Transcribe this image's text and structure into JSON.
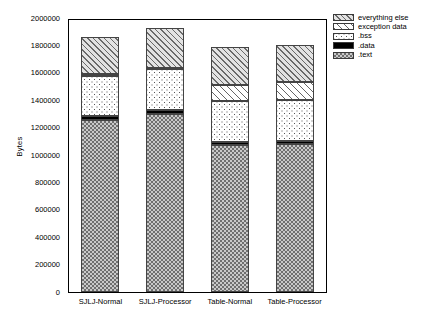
{
  "chart": {
    "type": "bar",
    "ylabel": "Bytes"
  },
  "yaxis": {
    "ticks": [
      "2000000",
      "1800000",
      "1600000",
      "1400000",
      "1200000",
      "1000000",
      "800000",
      "600000",
      "400000",
      "200000",
      "0"
    ]
  },
  "xaxis": {
    "labels": [
      "SJLJ-Normal",
      "SJLJ-Processor",
      "Table-Normal",
      "Table-Processor"
    ]
  },
  "legend": {
    "items": [
      {
        "label": "everything else",
        "pattern": "diagonal-hatch-gray"
      },
      {
        "label": "exception data",
        "pattern": "diagonal-hatch-light"
      },
      {
        "label": ".bss",
        "pattern": "dotted"
      },
      {
        "label": ".data",
        "pattern": "solid-black"
      },
      {
        "label": ".text",
        "pattern": "checkerboard"
      }
    ]
  },
  "chart_data": {
    "type": "bar",
    "stacked": true,
    "title": "",
    "xlabel": "",
    "ylabel": "Bytes",
    "ylim": [
      0,
      2000000
    ],
    "ytick_step": 200000,
    "grid": false,
    "legend_position": "right",
    "categories": [
      "SJLJ-Normal",
      "SJLJ-Processor",
      "Table-Normal",
      "Table-Processor"
    ],
    "series": [
      {
        "name": ".text",
        "values": [
          1255000,
          1300000,
          1070000,
          1080000
        ]
      },
      {
        "name": ".data",
        "values": [
          30000,
          25000,
          25000,
          25000
        ]
      },
      {
        "name": ".bss",
        "values": [
          295000,
          300000,
          300000,
          295000
        ]
      },
      {
        "name": "exception data",
        "values": [
          15000,
          10000,
          115000,
          130000
        ]
      },
      {
        "name": "everything else",
        "values": [
          270000,
          290000,
          275000,
          275000
        ]
      }
    ],
    "totals": [
      1865000,
      1925000,
      1785000,
      1805000
    ]
  }
}
